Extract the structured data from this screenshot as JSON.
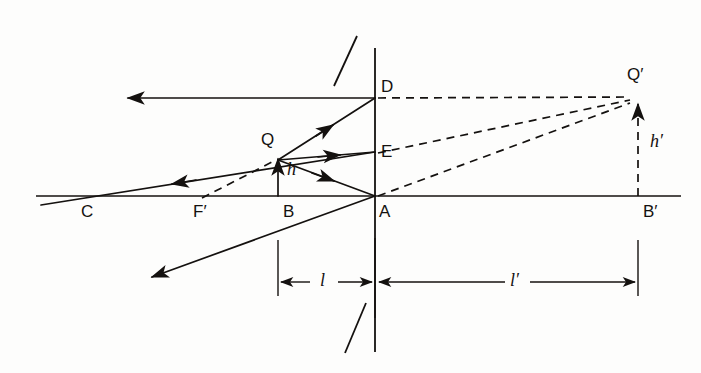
{
  "figure": {
    "kind": "optics-ray-diagram",
    "width": 701,
    "height": 373,
    "background_color": "#fdfdfc",
    "ink_color": "#14110f",
    "stroke_width": 1.6,
    "dash_pattern": "8,6"
  },
  "axis": {
    "name": "principal-axis",
    "y": 196,
    "x_start": 36,
    "x_end": 681
  },
  "lens": {
    "name": "lens-plane",
    "x": 375,
    "y_top": 48,
    "y_bottom": 352,
    "hatch_top": {
      "x1": 334,
      "y1": 86,
      "x2": 357,
      "y2": 36
    },
    "hatch_bottom": {
      "x1": 345,
      "y1": 353,
      "x2": 366,
      "y2": 303
    }
  },
  "points": [
    {
      "id": "C",
      "label": "C",
      "x": 88,
      "y": 196,
      "label_x": 81,
      "label_y": 203
    },
    {
      "id": "Fp",
      "label": "F′",
      "x": 205,
      "y": 196,
      "label_x": 193,
      "label_y": 203
    },
    {
      "id": "B",
      "label": "B",
      "x": 278,
      "y": 196,
      "label_x": 281,
      "label_y": 203
    },
    {
      "id": "Q",
      "label": "Q",
      "x": 278,
      "y": 160,
      "label_x": 263,
      "label_y": 134
    },
    {
      "id": "A",
      "label": "A",
      "x": 375,
      "y": 196,
      "label_x": 379,
      "label_y": 203
    },
    {
      "id": "E",
      "label": "E",
      "x": 375,
      "y": 155,
      "label_x": 381,
      "label_y": 161
    },
    {
      "id": "D",
      "label": "D",
      "x": 375,
      "y": 98,
      "label_x": 381,
      "label_y": 80
    },
    {
      "id": "Bp",
      "label": "B′",
      "x": 638,
      "y": 196,
      "label_x": 643,
      "label_y": 203
    },
    {
      "id": "Qp",
      "label": "Q′",
      "x": 638,
      "y": 97,
      "label_x": 629,
      "label_y": 68
    }
  ],
  "measure_labels": [
    {
      "id": "h",
      "text": "h",
      "x": 287,
      "y": 170
    },
    {
      "id": "h-prime",
      "text": "h′",
      "x": 651,
      "y": 142
    },
    {
      "id": "l",
      "text": "l",
      "x": 323,
      "y": 269
    },
    {
      "id": "l-prime",
      "text": "l′",
      "x": 516,
      "y": 269
    }
  ],
  "solid_rays": [
    {
      "id": "ray-D-left",
      "x1": 375,
      "y1": 98,
      "x2": 128,
      "y2": 98,
      "arrow_at": "end",
      "note": "refracted ray from D travelling left"
    },
    {
      "id": "ray-Q-to-D",
      "x1": 278,
      "y1": 160,
      "x2": 375,
      "y2": 98,
      "arrow_at": "mid",
      "note": "incident ray Q to D"
    },
    {
      "id": "ray-Q-to-E",
      "x1": 278,
      "y1": 160,
      "x2": 375,
      "y2": 152,
      "arrow_at": "mid",
      "note": "incident ray Q to E"
    },
    {
      "id": "ray-Q-to-A",
      "x1": 278,
      "y1": 160,
      "x2": 375,
      "y2": 196,
      "arrow_at": "mid",
      "note": "incident ray Q to A (through pole)"
    },
    {
      "id": "ray-E-through-Q-C",
      "x1": 375,
      "y1": 152,
      "x2": 41,
      "y2": 205,
      "arrow_at": "mid",
      "note": "refracted ray through optical centre toward C"
    },
    {
      "id": "ray-A-downleft",
      "x1": 375,
      "y1": 196,
      "x2": 152,
      "y2": 277,
      "arrow_at": "end",
      "note": "refracted ray from A going down-left"
    },
    {
      "id": "object-arrow-QB",
      "x1": 278,
      "y1": 196,
      "x2": 278,
      "y2": 158,
      "arrow_at": "end",
      "note": "object height h, arrow from B to Q"
    }
  ],
  "dashed_rays": [
    {
      "id": "virtual-D-to-Qp",
      "x1": 375,
      "y1": 98,
      "x2": 638,
      "y2": 97
    },
    {
      "id": "virtual-E-to-Qp",
      "x1": 375,
      "y1": 153,
      "x2": 638,
      "y2": 99
    },
    {
      "id": "virtual-A-to-Qp",
      "x1": 375,
      "y1": 196,
      "x2": 638,
      "y2": 100
    },
    {
      "id": "virtual-Fp-to-Q",
      "x1": 202,
      "y1": 198,
      "x2": 275,
      "y2": 160
    }
  ],
  "image_arrow": {
    "id": "image-arrow-QpBp",
    "x1": 638,
    "y1": 196,
    "x2": 638,
    "y2": 100,
    "arrow_at": "end",
    "dashed": true,
    "note": "virtual image height h' from B' up to Q'"
  },
  "dimension_lines": [
    {
      "id": "dim-l",
      "label": "l",
      "y": 282,
      "x_left": 278,
      "x_right": 375,
      "tick_left": {
        "x": 278,
        "y_top": 240,
        "y_bottom": 296
      },
      "tick_right": {
        "x": 375,
        "y_top": 238,
        "y_bottom": 318
      }
    },
    {
      "id": "dim-l-prime",
      "label": "l′",
      "y": 282,
      "x_left": 375,
      "x_right": 638,
      "tick_right": {
        "x": 638,
        "y_top": 240,
        "y_bottom": 296
      }
    }
  ]
}
